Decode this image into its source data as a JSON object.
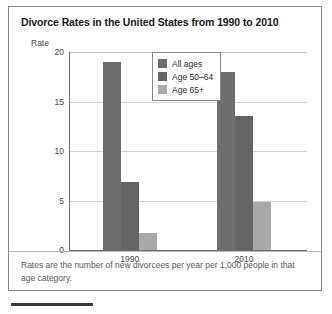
{
  "figure": {
    "title": "Divorce Rates in the United States from 1990 to 2010",
    "rate_axis_label": "Rate",
    "footnote": "Rates are the number of new divorcees per year per 1,000 people in that age category."
  },
  "chart_data": {
    "type": "bar",
    "title": "Divorce Rates in the United States from 1990 to 2010",
    "xlabel": "",
    "ylabel": "Rate",
    "ylim": [
      0,
      20
    ],
    "yticks": [
      "0",
      "5",
      "10",
      "15",
      "20"
    ],
    "ytick_values": [
      0,
      5,
      10,
      15,
      20
    ],
    "grid": true,
    "legend_position": "top-center",
    "categories": [
      "1990",
      "2010"
    ],
    "series": [
      {
        "name": "All ages",
        "color": "#6e6e6e",
        "values": [
          19.0,
          18.0
        ]
      },
      {
        "name": "Age 50–64",
        "color": "#646464",
        "values": [
          6.9,
          13.5
        ]
      },
      {
        "name": "Age 65+",
        "color": "#a9a9a9",
        "values": [
          1.7,
          4.8
        ]
      }
    ],
    "annotations": [
      "Rates are the number of new divorcees per year per 1,000 people in that age category."
    ]
  },
  "legend": {
    "entries": [
      {
        "label": "All ages"
      },
      {
        "label": "Age 50–64"
      },
      {
        "label": "Age 65+"
      }
    ]
  },
  "colors": {
    "all_ages": "#6e6e6e",
    "age_50_64": "#646464",
    "age_65_plus": "#a9a9a9",
    "frame": "#8a8a8a",
    "gridline": "#d2d2d2",
    "axis": "#6d6d6d",
    "title_text": "#1a1a1a",
    "tick_text": "#4a4a4a",
    "footnote_text": "#5a5a5a"
  }
}
